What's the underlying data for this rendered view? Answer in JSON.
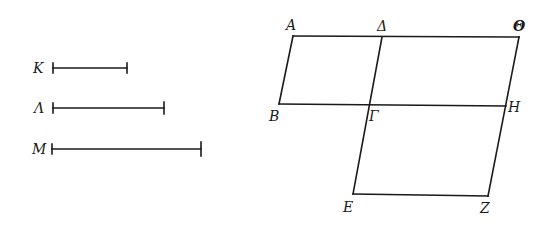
{
  "segments": {
    "K": {
      "label": "Κ",
      "x1": 53,
      "x2": 127,
      "y": 68
    },
    "L": {
      "label": "Λ",
      "x1": 53,
      "x2": 164,
      "y": 108
    },
    "M": {
      "label": "Μ",
      "x1": 52,
      "x2": 201,
      "y": 149
    }
  },
  "figure": {
    "points": {
      "A": {
        "label": "Α",
        "x": 293,
        "y": 36
      },
      "D": {
        "label": "Δ",
        "x": 382,
        "y": 37
      },
      "TH": {
        "label": "Θ",
        "x": 519,
        "y": 37
      },
      "B": {
        "label": "Β",
        "x": 279,
        "y": 104
      },
      "G": {
        "label": "Γ",
        "x": 370,
        "y": 105
      },
      "H": {
        "label": "Η",
        "x": 506,
        "y": 106
      },
      "E": {
        "label": "Ε",
        "x": 353,
        "y": 194
      },
      "Z": {
        "label": "Ζ",
        "x": 488,
        "y": 196
      }
    }
  },
  "colors": {
    "ink": "#1a1a1a",
    "background": "#ffffff"
  }
}
